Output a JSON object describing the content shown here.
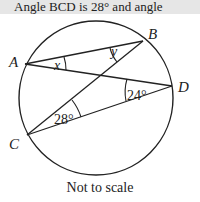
{
  "header": {
    "text": "Angle BCD is 28° and angle"
  },
  "diagram": {
    "points": {
      "A": "A",
      "B": "B",
      "C": "C",
      "D": "D"
    },
    "angles": {
      "x": "x",
      "y": "y",
      "c": "28°",
      "d": "24°"
    }
  },
  "note": "Not to scale"
}
